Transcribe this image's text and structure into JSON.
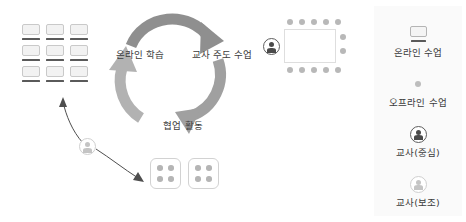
{
  "diagram": {
    "title_present": false,
    "cycle": {
      "labels": [
        {
          "id": "online-learning",
          "text": "온라인 학습"
        },
        {
          "id": "teacher-led-class",
          "text": "교사 주도 수업"
        },
        {
          "id": "collaborative-activity",
          "text": "협업 활동"
        }
      ],
      "arrow_color": "#9e9e9e",
      "arrow_color_dark": "#8a8a8a",
      "direction": "clockwise"
    },
    "nodes": [
      {
        "id": "online-grid",
        "icon": "online-class-grid-icon",
        "rows": 3,
        "cols": 3
      },
      {
        "id": "classroom",
        "icon": "classroom-seating-icon",
        "seats": 13,
        "teacher": "teacher-central"
      },
      {
        "id": "group-tables",
        "icon": "group-table-icon",
        "tables": 2,
        "seats_per_table": 4
      },
      {
        "id": "free-teacher",
        "icon": "teacher-assistant-icon"
      }
    ]
  },
  "legend": {
    "background": "#fafafa",
    "items": [
      {
        "icon": "monitor-icon",
        "label": "온라인 수업"
      },
      {
        "icon": "offline-dot-icon",
        "label": "오프라인 수업"
      },
      {
        "icon": "teacher-central-icon",
        "label": "교사(중심)"
      },
      {
        "icon": "teacher-assistant-icon",
        "label": "교사(보조)"
      }
    ]
  },
  "colors": {
    "text": "#3c3c3c",
    "arrow": "#9e9e9e",
    "seat": "#b8b8b8",
    "teacher_dark": "#4a4a4a",
    "teacher_light": "#c4c4c4",
    "panel": "#fafafa"
  }
}
